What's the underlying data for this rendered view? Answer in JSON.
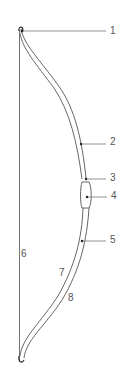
{
  "diagram": {
    "labels": [
      {
        "id": "1",
        "text": "1",
        "x": 110,
        "y": 26
      },
      {
        "id": "2",
        "text": "2",
        "x": 110,
        "y": 137
      },
      {
        "id": "3",
        "text": "3",
        "x": 110,
        "y": 173
      },
      {
        "id": "4",
        "text": "4",
        "x": 111,
        "y": 191
      },
      {
        "id": "5",
        "text": "5",
        "x": 110,
        "y": 235
      },
      {
        "id": "6",
        "text": "6",
        "x": 21,
        "y": 249
      },
      {
        "id": "7",
        "text": "7",
        "x": 59,
        "y": 268
      },
      {
        "id": "8",
        "text": "8",
        "x": 68,
        "y": 293
      }
    ],
    "colors": {
      "line": "#555555",
      "background": "#ffffff"
    }
  }
}
